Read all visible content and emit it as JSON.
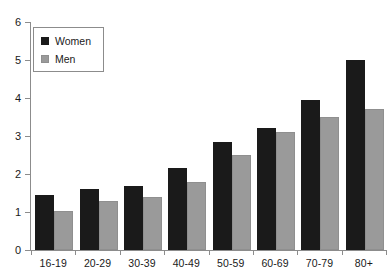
{
  "chart_data": {
    "type": "bar",
    "title": "",
    "subtitle": "",
    "xlabel": "",
    "ylabel": "",
    "categories": [
      "16-19",
      "20-29",
      "30-39",
      "40-49",
      "50-59",
      "60-69",
      "70-79",
      "80+"
    ],
    "series": [
      {
        "name": "Women",
        "color": "#1a1a1a",
        "values": [
          1.45,
          1.6,
          1.68,
          2.15,
          2.85,
          3.2,
          3.95,
          5.0
        ]
      },
      {
        "name": "Men",
        "color": "#9a9a9a",
        "values": [
          1.02,
          1.3,
          1.4,
          1.8,
          2.5,
          3.1,
          3.5,
          3.7
        ]
      }
    ],
    "ylim": [
      0,
      6
    ],
    "yticks": [
      0,
      1,
      2,
      3,
      4,
      5,
      6
    ],
    "ytick_labels": [
      "0",
      "1",
      "2",
      "3",
      "4",
      "5",
      "6"
    ],
    "grid": false,
    "legend": {
      "position": "top-left",
      "entries": [
        "Women",
        "Men"
      ]
    },
    "axis_color": "#8c8c8c",
    "background": "#ffffff"
  }
}
